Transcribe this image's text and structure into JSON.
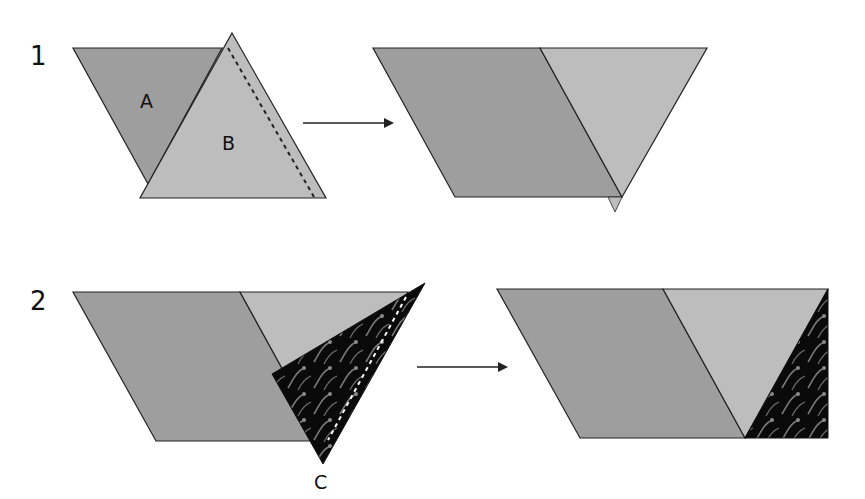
{
  "diagram": {
    "type": "quilt-piecing-steps",
    "colors": {
      "piece_a": "#9e9e9e",
      "piece_b": "#bdbdbd",
      "piece_c": "#0a0a0a",
      "fabric_swirl": "#7a7a7a",
      "outline": "#222222",
      "arrow": "#222222"
    },
    "steps": [
      {
        "number": "1",
        "labels": {
          "a": "A",
          "b": "B"
        },
        "seam": "dashed line along right edge of B"
      },
      {
        "number": "2",
        "labels": {
          "c": "C"
        },
        "seam": "white dashed line along triangle C"
      }
    ]
  }
}
